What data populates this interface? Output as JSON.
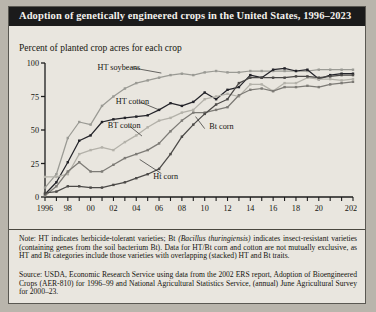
{
  "figure": {
    "title": "Adoption of genetically engineered crops in the United States, 1996–2023",
    "subtitle": "Percent of planted crop acres for each crop",
    "note_label": "Note:",
    "note_part1": " HT indicates herbicide-tolerant varieties; Bt ",
    "note_italic": "(Bacillus thuringiensis)",
    "note_part2": " indicates insect-resistant varieties (containing genes from the soil bacterium Bt). Data for HT/Bt corn and cotton are not mutually exclusive, as HT and Bt categories include those varieties with overlapping (stacked) HT and Bt traits.",
    "source_label": "Source:",
    "source_text": " USDA, Economic Research Service using data from the 2002 ERS report, Adoption of Bioengineered Crops (AER-810) for 1996–99 and National Agricultural Statistics Service, (annual) June Agricultural Survey for 2000–23."
  },
  "chart_data": {
    "type": "line",
    "title": "Adoption of genetically engineered crops in the United States, 1996–2023",
    "xlabel": "",
    "ylabel": "Percent of planted crop acres for each crop",
    "xlim": [
      1996,
      2023
    ],
    "ylim": [
      0,
      100
    ],
    "yticks": [
      0,
      25,
      50,
      75,
      100
    ],
    "ytick_labels": [
      "0",
      "25",
      "50",
      "75",
      "100"
    ],
    "xticks": [
      1996,
      1997,
      1998,
      1999,
      2000,
      2001,
      2002,
      2003,
      2004,
      2005,
      2006,
      2007,
      2008,
      2009,
      2010,
      2011,
      2012,
      2013,
      2014,
      2015,
      2016,
      2017,
      2018,
      2019,
      2020,
      2021,
      2022,
      2023
    ],
    "xtick_labels": [
      "1996",
      "",
      "98",
      "",
      "00",
      "",
      "02",
      "",
      "04",
      "",
      "06",
      "",
      "08",
      "",
      "10",
      "",
      "12",
      "",
      "14",
      "",
      "16",
      "",
      "18",
      "",
      "20",
      "",
      "",
      "2023"
    ],
    "grid": false,
    "legend": "inline-annotations",
    "x": [
      1996,
      1997,
      1998,
      1999,
      2000,
      2001,
      2002,
      2003,
      2004,
      2005,
      2006,
      2007,
      2008,
      2009,
      2010,
      2011,
      2012,
      2013,
      2014,
      2015,
      2016,
      2017,
      2018,
      2019,
      2020,
      2021,
      2022,
      2023
    ],
    "series": [
      {
        "name": "HT soybeans",
        "color": "#9a9a94",
        "label": "HT soybeans",
        "label_x": 2000.6,
        "label_y": 97,
        "values": [
          7,
          17,
          44,
          56,
          54,
          68,
          75,
          81,
          85,
          87,
          89,
          91,
          92,
          91,
          93,
          94,
          93,
          93,
          94,
          94,
          94,
          94,
          94,
          94,
          95,
          95,
          95,
          95
        ]
      },
      {
        "name": "HT cotton",
        "color": "#24242a",
        "label": "HT cotton",
        "label_x": 2002.2,
        "label_y": 72,
        "values": [
          2,
          11,
          26,
          42,
          46,
          56,
          58,
          59,
          60,
          61,
          65,
          70,
          68,
          71,
          78,
          73,
          80,
          82,
          91,
          89,
          95,
          96,
          94,
          95,
          88,
          91,
          92,
          92
        ]
      },
      {
        "name": "Bt cotton",
        "color": "#b3b1a9",
        "label": "BT cotton",
        "label_x": 2001.5,
        "label_y": 54,
        "values": [
          15,
          15,
          17,
          32,
          35,
          37,
          35,
          41,
          46,
          52,
          57,
          59,
          63,
          65,
          73,
          75,
          77,
          75,
          84,
          84,
          79,
          85,
          85,
          89,
          88,
          88,
          87,
          88
        ]
      },
      {
        "name": "Bt corn",
        "color": "#7d7b76",
        "label": "Bt corn",
        "label_x": 2010.4,
        "label_y": 53,
        "values": [
          1,
          8,
          19,
          26,
          19,
          19,
          24,
          29,
          32,
          35,
          40,
          49,
          57,
          63,
          63,
          65,
          67,
          76,
          80,
          81,
          79,
          82,
          82,
          83,
          82,
          84,
          85,
          86
        ]
      },
      {
        "name": "Ht corn",
        "color": "#4c4a48",
        "label": "Ht corn",
        "label_x": 2005.5,
        "label_y": 16,
        "values": [
          3,
          4,
          8,
          8,
          7,
          7,
          9,
          11,
          14,
          17,
          21,
          32,
          45,
          54,
          62,
          69,
          73,
          85,
          89,
          89,
          89,
          89,
          90,
          90,
          89,
          90,
          91,
          91
        ]
      }
    ]
  }
}
